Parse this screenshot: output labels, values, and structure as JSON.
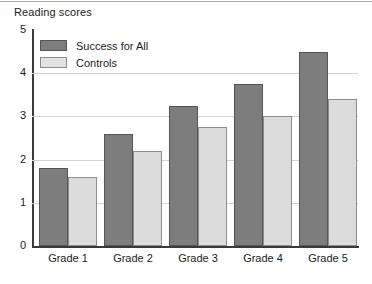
{
  "chart_data": {
    "type": "bar",
    "title": "Reading scores",
    "xlabel": "",
    "ylabel": "",
    "categories": [
      "Grade 1",
      "Grade 2",
      "Grade 3",
      "Grade 4",
      "Grade 5"
    ],
    "series": [
      {
        "name": "Success for All",
        "color": "#7d7d7d",
        "values": [
          1.8,
          2.6,
          3.25,
          3.75,
          4.5
        ]
      },
      {
        "name": "Controls",
        "color": "#dcdcdc",
        "values": [
          1.6,
          2.2,
          2.75,
          3.0,
          3.4
        ]
      }
    ],
    "ylim": [
      0,
      5
    ],
    "yticks": [
      "0",
      "1",
      "2",
      "3",
      "4",
      "5"
    ],
    "grid": true,
    "legend_position": "top-left"
  }
}
